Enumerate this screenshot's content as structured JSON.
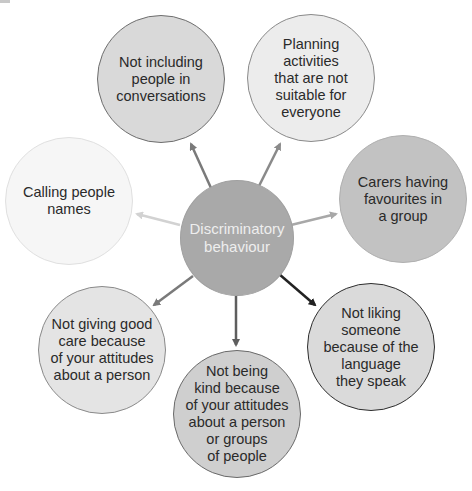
{
  "diagram": {
    "center": {
      "label": "Discriminatory\nbehaviour",
      "fill": "#a9a9a9",
      "border": "#a0a0a0",
      "text_color": "#eeeeee"
    },
    "nodes": [
      {
        "id": "not-including",
        "label": "Not including\npeople in\nconversations",
        "fill": "#d9d9d9",
        "border": "#6e6e6e",
        "arrow_color": "#7a7a7a"
      },
      {
        "id": "planning",
        "label": "Planning\nactivities\nthat are not\nsuitable for\neveryone",
        "fill": "#ececec",
        "border": "#8a8a8a",
        "arrow_color": "#8a8a8a"
      },
      {
        "id": "calling-names",
        "label": "Calling people\nnames",
        "fill": "#f6f6f6",
        "border": "#e0e0e0",
        "arrow_color": "#d2d2d2"
      },
      {
        "id": "carers-favourites",
        "label": "Carers having\nfavourites in\na group",
        "fill": "#c2c2c2",
        "border": "#b0b0b0",
        "arrow_color": "#a8a8a8"
      },
      {
        "id": "not-giving-care",
        "label": "Not giving good\ncare because\nof your attitudes\nabout a person",
        "fill": "#e4e4e4",
        "border": "#8a8a8a",
        "arrow_color": "#7a7a7a"
      },
      {
        "id": "not-being-kind",
        "label": "Not being\nkind because\nof your attitudes\nabout a person\nor groups\nof people",
        "fill": "#cfcfcf",
        "border": "#6a6a6a",
        "arrow_color": "#5e5e5e"
      },
      {
        "id": "not-liking-language",
        "label": "Not liking\nsomeone\nbecause of the\nlanguage\nthey speak",
        "fill": "#dadada",
        "border": "#2e2e2e",
        "arrow_color": "#222222"
      }
    ]
  }
}
